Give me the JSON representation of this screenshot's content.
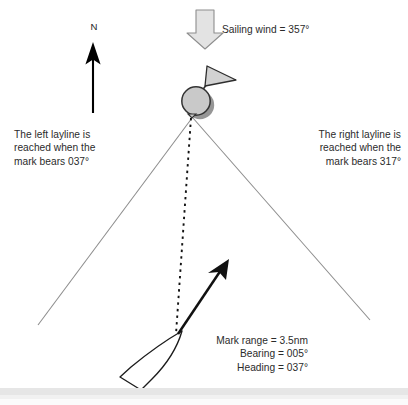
{
  "diagram": {
    "compass": {
      "north_label": "N"
    },
    "wind": {
      "label": "Sailing wind = 357°",
      "direction_deg": "357",
      "arrow_icon": "down-block-arrow-icon"
    },
    "mark": {
      "icon": "race-mark-buoy-icon",
      "flag_icon": "mark-flag-icon"
    },
    "laylines": {
      "left_text_line1": "The left layline is",
      "left_text_line2": "reached when the",
      "left_text_line3": "mark bears 037°",
      "right_text_line1": "The right layline is",
      "right_text_line2": "reached when the",
      "right_text_line3": "mark bears 317°"
    },
    "boat": {
      "icon": "sailing-boat-hull-icon",
      "heading_arrow_icon": "heading-arrow-icon",
      "data_line1": "Mark range = 3.5nm",
      "data_line2": "Bearing = 005°",
      "data_line3": "Heading = 037°",
      "mark_range": "3.5nm",
      "bearing_deg": "005",
      "heading_deg": "037"
    },
    "colors": {
      "layline": "#8c8c8c",
      "bearing_line": "#111111",
      "mark_fill": "#c9c9c9",
      "mark_stroke": "#3a3a3a",
      "mark_shadow": "#6e6e6e",
      "wind_fill": "#e3e3e3",
      "wind_stroke": "#8a8a8a",
      "boat_stroke": "#1c1c1c",
      "north_arrow": "#000000",
      "text": "#2b2b2b",
      "bottom_band": "#e6e6e6"
    }
  }
}
